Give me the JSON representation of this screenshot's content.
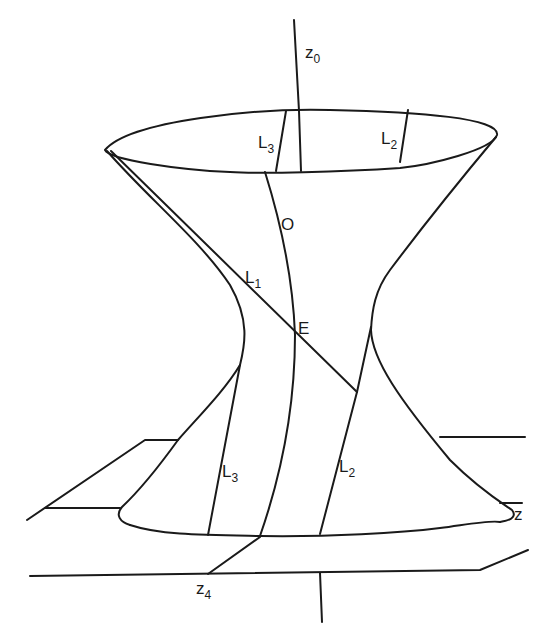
{
  "figure": {
    "stroke_color": "#1a1a1a",
    "background_color": "#ffffff"
  },
  "labels": {
    "z0": {
      "main": "z",
      "sub": "0"
    },
    "l3_top": {
      "main": "L",
      "sub": "3"
    },
    "l2_top": {
      "main": "L",
      "sub": "2"
    },
    "o": {
      "main": "O"
    },
    "l1": {
      "main": "L",
      "sub": "1"
    },
    "e": {
      "main": "E"
    },
    "l3_bottom": {
      "main": "L",
      "sub": "3"
    },
    "l2_bottom": {
      "main": "L",
      "sub": "2"
    },
    "z": {
      "main": "z"
    },
    "z4": {
      "main": "z",
      "sub": "4"
    }
  }
}
